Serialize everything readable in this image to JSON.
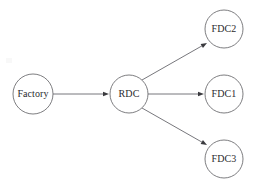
{
  "canvas": {
    "width": 256,
    "height": 186,
    "background": "#ffffff",
    "title": "Supply Chain Distribution Network"
  },
  "style": {
    "node_fill": "#ffffff",
    "node_stroke": "#6e6e72",
    "edge_stroke": "#68686d",
    "arrow_fill": "#3a3a3e",
    "label_color": "#2b2b2e",
    "node_radius": 19,
    "label_font_size": 10,
    "stroke_width": 0.9
  },
  "nodes": [
    {
      "id": "factory",
      "label": "Factory",
      "cx": 33,
      "cy": 94,
      "r": 20
    },
    {
      "id": "rdc",
      "label": "RDC",
      "cx": 129,
      "cy": 94,
      "r": 19
    },
    {
      "id": "fdc2",
      "label": "FDC2",
      "cx": 224,
      "cy": 29,
      "r": 19
    },
    {
      "id": "fdc1",
      "label": "FDC1",
      "cx": 224,
      "cy": 94,
      "r": 19
    },
    {
      "id": "fdc3",
      "label": "FDC3",
      "cx": 224,
      "cy": 159,
      "r": 19
    }
  ],
  "edges": [
    {
      "id": "factory-to-rdc",
      "from": "factory",
      "to": "rdc",
      "label": "",
      "x1": 53,
      "y1": 94,
      "x2": 109,
      "y2": 94,
      "arrow_angle_deg": 0
    },
    {
      "id": "rdc-to-fdc2",
      "from": "rdc",
      "to": "fdc2",
      "label": "",
      "x1": 142,
      "y1": 80,
      "x2": 207,
      "y2": 43,
      "arrow_angle_deg": -29.6
    },
    {
      "id": "rdc-to-fdc1",
      "from": "rdc",
      "to": "fdc1",
      "label": "",
      "x1": 148,
      "y1": 94,
      "x2": 204,
      "y2": 94,
      "arrow_angle_deg": 0
    },
    {
      "id": "rdc-to-fdc3",
      "from": "rdc",
      "to": "fdc3",
      "label": "",
      "x1": 142,
      "y1": 108,
      "x2": 207,
      "y2": 145,
      "arrow_angle_deg": 29.6
    }
  ]
}
